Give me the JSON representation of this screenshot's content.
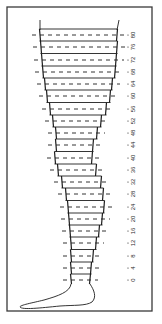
{
  "figure": {
    "frame": {
      "x": 7,
      "y": 7,
      "width": 145,
      "height": 304,
      "color": "#3a3a3a"
    },
    "ink_color": "#1e1e1e",
    "label_color": "#2a2a2a",
    "axis": {
      "unit_step": 4,
      "labels": [
        "0",
        "4",
        "8",
        "12",
        "16",
        "20",
        "24",
        "28",
        "32",
        "36",
        "40",
        "44",
        "48",
        "52",
        "56",
        "60",
        "64",
        "68",
        "72",
        "76",
        "80"
      ],
      "label_x": 133,
      "tick_x": 128,
      "orientation": "rotated-90"
    },
    "levels": [
      {
        "value": 80,
        "y": 35,
        "left": 40,
        "right": 117
      },
      {
        "value": 76,
        "y": 47,
        "left": 41,
        "right": 117
      },
      {
        "value": 72,
        "y": 60,
        "left": 42,
        "right": 116
      },
      {
        "value": 68,
        "y": 72,
        "left": 43,
        "right": 115
      },
      {
        "value": 64,
        "y": 84,
        "left": 45,
        "right": 112
      },
      {
        "value": 60,
        "y": 96,
        "left": 47,
        "right": 110
      },
      {
        "value": 56,
        "y": 109,
        "left": 50,
        "right": 106
      },
      {
        "value": 52,
        "y": 121,
        "left": 53,
        "right": 101
      },
      {
        "value": 48,
        "y": 133,
        "left": 56,
        "right": 97
      },
      {
        "value": 44,
        "y": 145,
        "left": 56,
        "right": 93
      },
      {
        "value": 40,
        "y": 158,
        "left": 55,
        "right": 92
      },
      {
        "value": 36,
        "y": 170,
        "left": 58,
        "right": 96
      },
      {
        "value": 32,
        "y": 182,
        "left": 62,
        "right": 101
      },
      {
        "value": 28,
        "y": 194,
        "left": 66,
        "right": 103
      },
      {
        "value": 24,
        "y": 207,
        "left": 68,
        "right": 104
      },
      {
        "value": 20,
        "y": 219,
        "left": 69,
        "right": 102
      },
      {
        "value": 16,
        "y": 231,
        "left": 70,
        "right": 99
      },
      {
        "value": 12,
        "y": 243,
        "left": 71,
        "right": 96
      },
      {
        "value": 8,
        "y": 256,
        "left": 71,
        "right": 93
      },
      {
        "value": 4,
        "y": 268,
        "left": 71,
        "right": 91
      },
      {
        "value": 0,
        "y": 280,
        "left": 71,
        "right": 90
      }
    ],
    "top_lines": {
      "left_x1": 40,
      "left_x2": 40,
      "right_x1": 119,
      "right_x2": 117,
      "y1": 20,
      "y2": 30
    },
    "foot_path": "M71 284 C70 292 58 296 44 300 C32 303 20 305 20 307 C22 310 40 308 60 306 C74 305 86 306 92 302 C97 297 94 290 90 284"
  }
}
